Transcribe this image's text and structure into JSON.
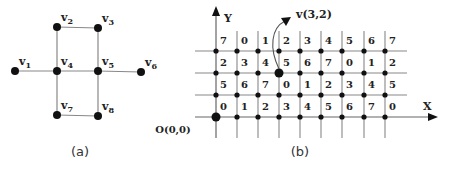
{
  "figure_a": {
    "caption": "(a)",
    "vertices": [
      {
        "id": "v1",
        "label": "v",
        "sub": "1",
        "x": 15,
        "y": 71
      },
      {
        "id": "v2",
        "label": "v",
        "sub": "2",
        "x": 57,
        "y": 27
      },
      {
        "id": "v3",
        "label": "v",
        "sub": "3",
        "x": 98,
        "y": 28
      },
      {
        "id": "v4",
        "label": "v",
        "sub": "4",
        "x": 57,
        "y": 71
      },
      {
        "id": "v5",
        "label": "v",
        "sub": "5",
        "x": 98,
        "y": 71
      },
      {
        "id": "v6",
        "label": "v",
        "sub": "6",
        "x": 141,
        "y": 72
      },
      {
        "id": "v7",
        "label": "v",
        "sub": "7",
        "x": 57,
        "y": 115
      },
      {
        "id": "v8",
        "label": "v",
        "sub": "8",
        "x": 98,
        "y": 116
      }
    ],
    "edges": [
      [
        "v1",
        "v4"
      ],
      [
        "v4",
        "v5"
      ],
      [
        "v5",
        "v6"
      ],
      [
        "v2",
        "v3"
      ],
      [
        "v2",
        "v4"
      ],
      [
        "v3",
        "v5"
      ],
      [
        "v4",
        "v7"
      ],
      [
        "v5",
        "v8"
      ],
      [
        "v7",
        "v8"
      ]
    ]
  },
  "figure_b": {
    "caption": "(b)",
    "y_axis_label": "Y",
    "x_axis_label": "X",
    "origin_label": "O(0,0)",
    "highlight_label": "v(3,2)",
    "highlight": {
      "col": 3,
      "row": 2
    },
    "columns_x": [
      216,
      237,
      258,
      279,
      300,
      321,
      342,
      364,
      385
    ],
    "rows_y": [
      117,
      95,
      73,
      51
    ],
    "rows": [
      [
        "0",
        "1",
        "2",
        "3",
        "4",
        "5",
        "6",
        "7",
        "0"
      ],
      [
        "5",
        "6",
        "7",
        "0",
        "1",
        "2",
        "3",
        "4",
        "5"
      ],
      [
        "2",
        "3",
        "4",
        "5",
        "6",
        "7",
        "0",
        "1",
        "2"
      ],
      [
        "7",
        "0",
        "1",
        "2",
        "3",
        "4",
        "5",
        "6",
        "7"
      ]
    ]
  }
}
